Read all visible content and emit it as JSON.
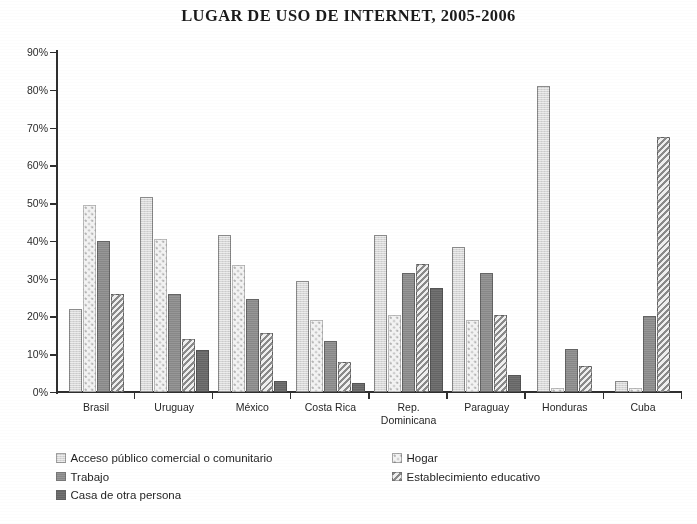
{
  "chart_data": {
    "type": "bar",
    "title": "LUGAR DE USO DE INTERNET, 2005-2006",
    "xlabel": "",
    "ylabel": "",
    "ylim": [
      0,
      90
    ],
    "ytick_labels": [
      "90%",
      "80%",
      "70%",
      "60%",
      "50%",
      "40%",
      "30%",
      "20%",
      "10%",
      "0%"
    ],
    "ytick_values": [
      90,
      80,
      70,
      60,
      50,
      40,
      30,
      20,
      10,
      0
    ],
    "grid": false,
    "legend_position": "bottom",
    "categories": [
      "Brasil",
      "Uruguay",
      "México",
      "Costa Rica",
      "Rep. Dominicana",
      "Paraguay",
      "Honduras",
      "Cuba"
    ],
    "category_lines": [
      [
        "Brasil",
        ""
      ],
      [
        "Uruguay",
        ""
      ],
      [
        "México",
        ""
      ],
      [
        "Costa Rica",
        ""
      ],
      [
        "Rep.",
        "Dominicana"
      ],
      [
        "Paraguay",
        ""
      ],
      [
        "Honduras",
        ""
      ],
      [
        "Cuba",
        ""
      ]
    ],
    "series": [
      {
        "name": "Acceso público comercial o comunitario",
        "key": "acceso",
        "color": "#d6d6d6",
        "pattern": "solid-light",
        "values": [
          22,
          51.5,
          41.5,
          29.5,
          41.5,
          38.5,
          81,
          3
        ]
      },
      {
        "name": "Hogar",
        "key": "hogar",
        "color": "#f3f3f3",
        "pattern": "dotted",
        "values": [
          49.5,
          40.5,
          33.5,
          19,
          20.5,
          19,
          1,
          1
        ]
      },
      {
        "name": "Trabajo",
        "key": "trabajo",
        "color": "#8e8e8e",
        "pattern": "solid-medium",
        "values": [
          40,
          26,
          24.5,
          13.5,
          31.5,
          31.5,
          11.5,
          20
        ]
      },
      {
        "name": "Establecimiento educativo",
        "key": "educativo",
        "color": "#8a8a8a",
        "pattern": "diagonal-hatch",
        "values": [
          26,
          14,
          15.5,
          8,
          34,
          20.5,
          7,
          67.5
        ]
      },
      {
        "name": "Casa de otra persona",
        "key": "casa",
        "color": "#6a6a6a",
        "pattern": "solid-dark",
        "values": [
          0,
          11,
          3,
          2.5,
          27.5,
          4.5,
          0,
          0
        ]
      }
    ]
  },
  "legend": {
    "left_column": [
      "Acceso público comercial o comunitario",
      "Trabajo",
      "Casa de otra persona"
    ],
    "right_column": [
      "Hogar",
      "Establecimiento educativo"
    ]
  }
}
